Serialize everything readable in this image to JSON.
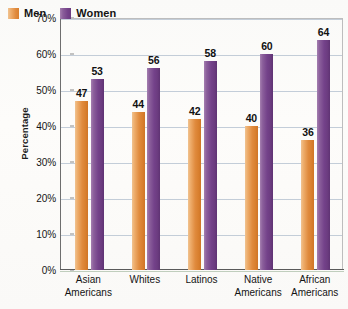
{
  "chart_data": {
    "type": "bar",
    "title": "",
    "subtitle": "",
    "xlabel": "",
    "ylabel": "Percentage",
    "ylim": [
      0,
      70
    ],
    "ytick_step": 10,
    "ytick_labels": [
      "0%",
      "10%",
      "20%",
      "30%",
      "40%",
      "50%",
      "60%",
      "70%"
    ],
    "ytick_values": [
      0,
      10,
      20,
      30,
      40,
      50,
      60,
      70
    ],
    "grid": true,
    "grid_axis": "y",
    "legend_position": "top-left",
    "value_labels": true,
    "categories": [
      "Asian Americans",
      "Whites",
      "Latinos",
      "Native Americans",
      "African Americans"
    ],
    "category_lines": [
      [
        "Asian",
        "Americans"
      ],
      [
        "Whites"
      ],
      [
        "Latinos"
      ],
      [
        "Native",
        "Americans"
      ],
      [
        "African",
        "Americans"
      ]
    ],
    "series": [
      {
        "name": "Men",
        "color": "#e08b3e",
        "values": [
          47,
          44,
          42,
          40,
          36
        ]
      },
      {
        "name": "Women",
        "color": "#74428a",
        "values": [
          53,
          56,
          58,
          60,
          64
        ]
      }
    ]
  },
  "legend": {
    "items": [
      {
        "label": "Men",
        "color": "#e08b3e"
      },
      {
        "label": "Women",
        "color": "#74428a"
      }
    ]
  },
  "axis": {
    "y_title": "Percentage"
  },
  "colors": {
    "men": "#e08b3e",
    "women": "#74428a",
    "gridline": "#b9c4d2",
    "axis": "#5a5a5a",
    "background": "#fdfdfb",
    "text": "#141414"
  }
}
